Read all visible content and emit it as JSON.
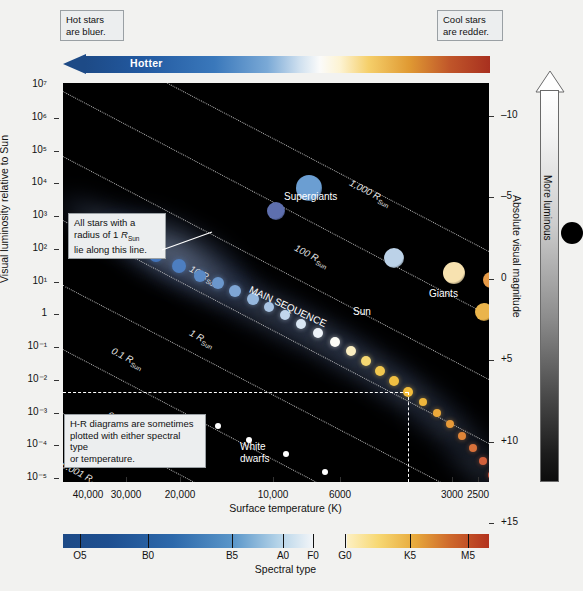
{
  "figure": {
    "hotter_label": "Hotter",
    "hot_callout": "Hot stars\nare bluer.",
    "cool_callout": "Cool stars\nare redder.",
    "radius_callout": "All stars with a\nradius of 1 RSun\nlie along this line.",
    "hr_callout": "H-R diagrams are sometimes\nplotted with either spectral type\nor temperature.",
    "more_luminous": "More luminous"
  },
  "axes": {
    "y_label": "Visual luminosity relative to Sun",
    "y_ticks": [
      "10⁷",
      "10⁶",
      "10⁵",
      "10⁴",
      "10³",
      "10²",
      "10¹",
      "1",
      "10⁻¹",
      "10⁻²",
      "10⁻³",
      "10⁻⁴",
      "10⁻⁵"
    ],
    "x_label": "Surface temperature (K)",
    "x_ticks": [
      "40,000",
      "30,000",
      "20,000",
      "10,000",
      "6000",
      "3000",
      "2500"
    ],
    "right_label": "Absolute visual magnitude",
    "right_ticks": [
      "–10",
      "–5",
      "0",
      "+5",
      "+10",
      "+15"
    ]
  },
  "spectral": {
    "title": "Spectral type",
    "types": [
      "O5",
      "B0",
      "B5",
      "A0",
      "F0",
      "G0",
      "K5",
      "M5"
    ]
  },
  "plot_labels": {
    "supergiants": "Supergiants",
    "giants": "Giants",
    "main_sequence": "MAIN SEQUENCE",
    "white_dwarfs": "White\ndwarfs",
    "sun": "Sun"
  },
  "radius_lines": [
    {
      "label": "1,000 R",
      "sub": "Sun"
    },
    {
      "label": "100 R",
      "sub": "Sun"
    },
    {
      "label": "10 R",
      "sub": "Sun"
    },
    {
      "label": "1 R",
      "sub": "Sun"
    },
    {
      "label": "0.1 R",
      "sub": "Sun"
    },
    {
      "label": "0.01 R",
      "sub": "Sun"
    },
    {
      "label": "0.001 R",
      "sub": "Sun"
    }
  ],
  "colors": {
    "hot_blue": "#1d4a86",
    "cool_red": "#a8301f",
    "plot_bg": "#000000",
    "callout_bg": "#eceeef",
    "grid_dotted": "#cfcfcf"
  },
  "chart_data": {
    "type": "scatter",
    "xlabel": "Surface temperature (K)",
    "ylabel": "Visual luminosity relative to Sun",
    "xlim": [
      50000,
      2300
    ],
    "ylim": [
      1e-05,
      10000000.0
    ],
    "xscale": "log-reversed",
    "yscale": "log",
    "grid": "dotted constant-radius lines",
    "legend": "none",
    "groups": [
      {
        "name": "Supergiants",
        "note": "upper region, L ~ 1e4 to 1e6 Lsun"
      },
      {
        "name": "Giants",
        "note": "right-of-centre, L ~ 1e2 to 1e4 Lsun"
      },
      {
        "name": "Main sequence",
        "note": "diagonal band from hot-luminous to cool-faint"
      },
      {
        "name": "White dwarfs",
        "note": "lower-left, L ~ 1e-2 to 1e-4 Lsun"
      }
    ],
    "annotations": [
      {
        "text": "Sun",
        "T": 5800,
        "L": 1
      },
      {
        "text": "1,000 RSun"
      },
      {
        "text": "100 RSun"
      },
      {
        "text": "10 RSun"
      },
      {
        "text": "1 RSun"
      },
      {
        "text": "0.1 RSun"
      },
      {
        "text": "0.01 RSun"
      },
      {
        "text": "0.001 RSun"
      }
    ],
    "stars": [
      {
        "group": "supergiant",
        "x": 246,
        "y": 105,
        "r": 13,
        "color": "#6b9ed2"
      },
      {
        "group": "supergiant",
        "x": 213,
        "y": 128,
        "r": 9,
        "color": "#5e6fae"
      },
      {
        "group": "supergiant",
        "x": 461,
        "y": 113,
        "r": 19,
        "color": "#bf3a22"
      },
      {
        "group": "supergiant",
        "x": 457,
        "y": 160,
        "r": 16,
        "color": "#bf3a22"
      },
      {
        "group": "supergiant",
        "x": 452,
        "y": 196,
        "r": 12,
        "color": "#c1452a"
      },
      {
        "group": "bright-giant",
        "x": 331,
        "y": 175,
        "r": 10,
        "color": "#bcd2e8"
      },
      {
        "group": "giant",
        "x": 391,
        "y": 190,
        "r": 11,
        "color": "#f7e2b0"
      },
      {
        "group": "giant",
        "x": 428,
        "y": 197,
        "r": 8,
        "color": "#e69a47"
      },
      {
        "group": "giant",
        "x": 441,
        "y": 208,
        "r": 8,
        "color": "#de6a35"
      },
      {
        "group": "giant",
        "x": 421,
        "y": 229,
        "r": 9,
        "color": "#eab44b"
      },
      {
        "group": "ms",
        "x": 71,
        "y": 160,
        "r": 7,
        "color": "#3d6fb8"
      },
      {
        "group": "ms",
        "x": 93,
        "y": 172,
        "r": 7,
        "color": "#4274bb"
      },
      {
        "group": "ms",
        "x": 116,
        "y": 183,
        "r": 7,
        "color": "#4d7ec0"
      },
      {
        "group": "ms",
        "x": 137,
        "y": 193,
        "r": 6,
        "color": "#5b8ac6"
      },
      {
        "group": "ms",
        "x": 155,
        "y": 200,
        "r": 6,
        "color": "#6b97cc"
      },
      {
        "group": "ms",
        "x": 172,
        "y": 208,
        "r": 6,
        "color": "#7ea5d4"
      },
      {
        "group": "ms",
        "x": 190,
        "y": 216,
        "r": 6,
        "color": "#95b7dd"
      },
      {
        "group": "ms",
        "x": 206,
        "y": 224,
        "r": 5,
        "color": "#a9c5e4"
      },
      {
        "group": "ms",
        "x": 222,
        "y": 232,
        "r": 5,
        "color": "#c1d6ec"
      },
      {
        "group": "ms",
        "x": 238,
        "y": 241,
        "r": 5,
        "color": "#d9e6f3"
      },
      {
        "group": "ms",
        "x": 255,
        "y": 250,
        "r": 5,
        "color": "#eef3f9"
      },
      {
        "group": "ms",
        "x": 272,
        "y": 259,
        "r": 5,
        "color": "#fdfdf6"
      },
      {
        "group": "ms",
        "x": 288,
        "y": 268,
        "r": 5,
        "color": "#fbeec1"
      },
      {
        "group": "ms",
        "x": 303,
        "y": 278,
        "r": 5,
        "color": "#f6d872"
      },
      {
        "group": "ms",
        "x": 317,
        "y": 288,
        "r": 5,
        "color": "#f2c84f"
      },
      {
        "group": "ms",
        "x": 331,
        "y": 298,
        "r": 5,
        "color": "#f0bf42"
      },
      {
        "group": "sun",
        "x": 345,
        "y": 309,
        "r": 5,
        "color": "#f3bd3b"
      },
      {
        "group": "ms",
        "x": 360,
        "y": 319,
        "r": 4,
        "color": "#efb63c"
      },
      {
        "group": "ms",
        "x": 374,
        "y": 330,
        "r": 4,
        "color": "#eca93a"
      },
      {
        "group": "ms",
        "x": 387,
        "y": 341,
        "r": 4,
        "color": "#e89a38"
      },
      {
        "group": "ms",
        "x": 399,
        "y": 353,
        "r": 4,
        "color": "#e08538"
      },
      {
        "group": "ms",
        "x": 410,
        "y": 365,
        "r": 4,
        "color": "#d9713a"
      },
      {
        "group": "ms",
        "x": 420,
        "y": 378,
        "r": 4,
        "color": "#d2603b"
      },
      {
        "group": "ms",
        "x": 429,
        "y": 392,
        "r": 4,
        "color": "#c9513c"
      },
      {
        "group": "ms",
        "x": 437,
        "y": 407,
        "r": 4,
        "color": "#c2463c"
      },
      {
        "group": "ms",
        "x": 444,
        "y": 422,
        "r": 4,
        "color": "#ba3c39"
      },
      {
        "group": "wd",
        "x": 155,
        "y": 343,
        "r": 3,
        "color": "#ffffff"
      },
      {
        "group": "wd",
        "x": 186,
        "y": 357,
        "r": 3,
        "color": "#ffffff"
      },
      {
        "group": "wd",
        "x": 223,
        "y": 371,
        "r": 3,
        "color": "#ffffff"
      },
      {
        "group": "wd",
        "x": 262,
        "y": 389,
        "r": 3,
        "color": "#ffffff"
      }
    ]
  }
}
